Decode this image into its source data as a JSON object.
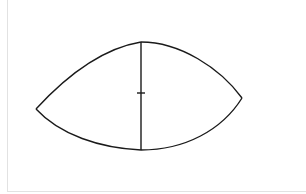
{
  "diagram": {
    "canvas": {
      "width": 306,
      "height": 194,
      "background": "#ffffff",
      "border_color": "#e2e2e2"
    },
    "stroke_color": "#1a1a1a",
    "shape": {
      "type": "lens",
      "left_tip": [
        36,
        109
      ],
      "right_tip": [
        242,
        98
      ],
      "top": [
        141,
        42
      ],
      "bottom": [
        141,
        150
      ]
    },
    "vertical_line": {
      "x": 141,
      "y1": 42,
      "y2": 150
    },
    "tick_mark": {
      "y": 93,
      "x1": 137,
      "x2": 145
    }
  }
}
